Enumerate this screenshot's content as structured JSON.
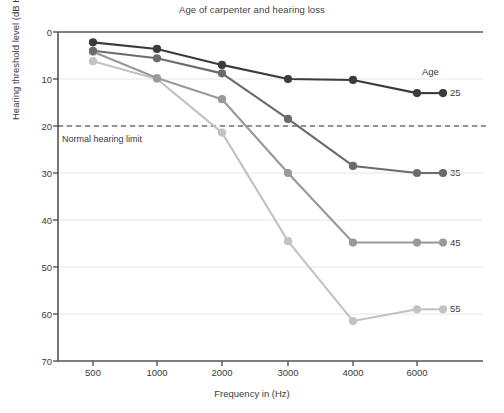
{
  "chart_data": {
    "type": "line",
    "title": "Age of carpenter and hearing loss",
    "xlabel": "Frequency in (Hz)",
    "ylabel": "Hearing threshold level (dB HL)",
    "x": [
      500,
      1000,
      2000,
      3000,
      4000,
      6000
    ],
    "categories": [
      "500",
      "1000",
      "2000",
      "3000",
      "4000",
      "6000"
    ],
    "xtick_labels": [
      "500",
      "1000",
      "2000",
      "3000",
      "4000",
      "6000"
    ],
    "ytick_labels": [
      "0",
      "10",
      "20",
      "30",
      "40",
      "50",
      "60",
      "70"
    ],
    "yticks": [
      0,
      10,
      20,
      30,
      40,
      50,
      60,
      70
    ],
    "ylim": [
      0,
      70
    ],
    "y_inverted": true,
    "grid": "horizontal",
    "legend_position": "right-outside",
    "legend_title": "Age",
    "series": [
      {
        "name": "25",
        "label": "25",
        "color": "#3b3b3b",
        "values": [
          2.2,
          3.6,
          7.0,
          10.0,
          10.2,
          13.0
        ]
      },
      {
        "name": "35",
        "label": "35",
        "color": "#6b6b6b",
        "values": [
          4.0,
          5.6,
          8.8,
          18.5,
          28.5,
          30.0
        ]
      },
      {
        "name": "45",
        "label": "45",
        "color": "#999999",
        "values": [
          4.2,
          9.8,
          14.3,
          30.0,
          44.8,
          44.8
        ]
      },
      {
        "name": "55",
        "label": "55",
        "color": "#c2c2c2",
        "values": [
          6.2,
          10.0,
          21.4,
          44.5,
          61.5,
          59.0
        ]
      }
    ],
    "annotations": [
      {
        "name": "normal-hearing-limit",
        "text": "Normal hearing limit",
        "y": 20,
        "style": "dashed-horizontal-line"
      }
    ]
  },
  "axis": {
    "ytick_0": "0",
    "ytick_10": "10",
    "ytick_20": "20",
    "ytick_30": "30",
    "ytick_40": "40",
    "ytick_50": "50",
    "ytick_60": "60",
    "ytick_70": "70",
    "xtick_500": "500",
    "xtick_1000": "1000",
    "xtick_2000": "2000",
    "xtick_3000": "3000",
    "xtick_4000": "4000",
    "xtick_6000": "6000"
  },
  "legend": {
    "title": "Age",
    "item_25": "25",
    "item_35": "35",
    "item_45": "45",
    "item_55": "55"
  },
  "annotation": {
    "normal_limit": "Normal hearing limit"
  },
  "colors": {
    "series_25": "#3b3b3b",
    "series_35": "#6b6b6b",
    "series_45": "#999999",
    "series_55": "#c2c2c2",
    "axis": "#555555",
    "grid": "#e6e6e6",
    "background": "#ffffff"
  }
}
